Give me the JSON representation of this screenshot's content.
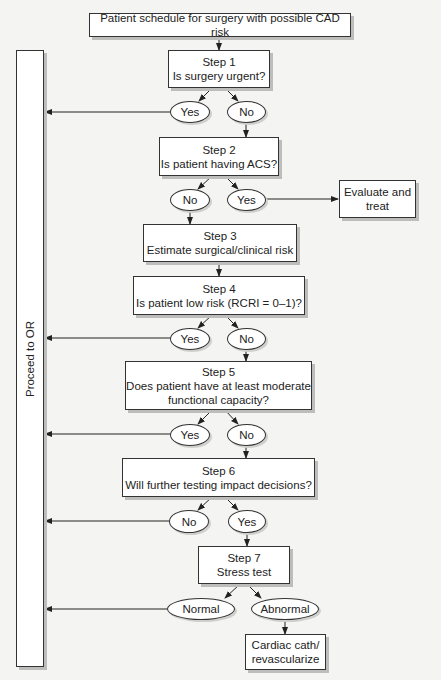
{
  "diagram": {
    "start": "Patient schedule for surgery with possible CAD risk",
    "proceed_bar": "Proceed to OR",
    "steps": [
      {
        "step": "Step 1",
        "question": "Is surgery urgent?"
      },
      {
        "step": "Step 2",
        "question": "Is patient having ACS?"
      },
      {
        "step": "Step 3",
        "question": "Estimate surgical/clinical risk"
      },
      {
        "step": "Step 4",
        "question": "Is patient low risk (RCRI = 0–1)?"
      },
      {
        "step": "Step 5",
        "question_line1": "Does patient have at least moderate",
        "question_line2": "functional capacity?"
      },
      {
        "step": "Step 6",
        "question": "Will further testing impact decisions?"
      },
      {
        "step": "Step 7",
        "question": "Stress test"
      }
    ],
    "answers": {
      "s1_yes": "Yes",
      "s1_no": "No",
      "s2_no": "No",
      "s2_yes": "Yes",
      "s4_yes": "Yes",
      "s4_no": "No",
      "s5_yes": "Yes",
      "s5_no": "No",
      "s6_no": "No",
      "s6_yes": "Yes",
      "s7_normal": "Normal",
      "s7_abnormal": "Abnormal"
    },
    "evaluate": {
      "line1": "Evaluate and",
      "line2": "treat"
    },
    "cath": {
      "line1": "Cardiac cath/",
      "line2": "revascularize"
    }
  }
}
